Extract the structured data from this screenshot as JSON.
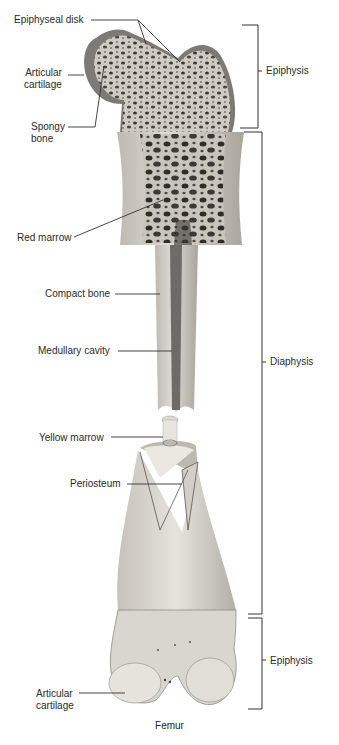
{
  "diagram": {
    "title": "Femur",
    "left_labels": [
      {
        "id": "epiphyseal-disk",
        "text": "Epiphyseal disk"
      },
      {
        "id": "articular-cartilage-top",
        "line1": "Articular",
        "line2": "cartilage"
      },
      {
        "id": "spongy-bone",
        "line1": "Spongy",
        "line2": "bone"
      },
      {
        "id": "red-marrow",
        "text": "Red marrow"
      },
      {
        "id": "compact-bone",
        "text": "Compact bone"
      },
      {
        "id": "medullary-cavity",
        "text": "Medullary cavity"
      },
      {
        "id": "yellow-marrow",
        "text": "Yellow marrow"
      },
      {
        "id": "periosteum",
        "text": "Periosteum"
      },
      {
        "id": "articular-cartilage-bottom",
        "line1": "Articular",
        "line2": "cartilage"
      }
    ],
    "regions": [
      {
        "id": "epiphysis-top",
        "text": "Epiphysis"
      },
      {
        "id": "diaphysis",
        "text": "Diaphysis"
      },
      {
        "id": "epiphysis-bottom",
        "text": "Epiphysis"
      }
    ],
    "colors": {
      "bone": "#d9d6cf",
      "bone_shadow": "#a8a49c",
      "cartilage": "#7d7a76",
      "pores": "#3a3835",
      "line": "#333333"
    }
  }
}
